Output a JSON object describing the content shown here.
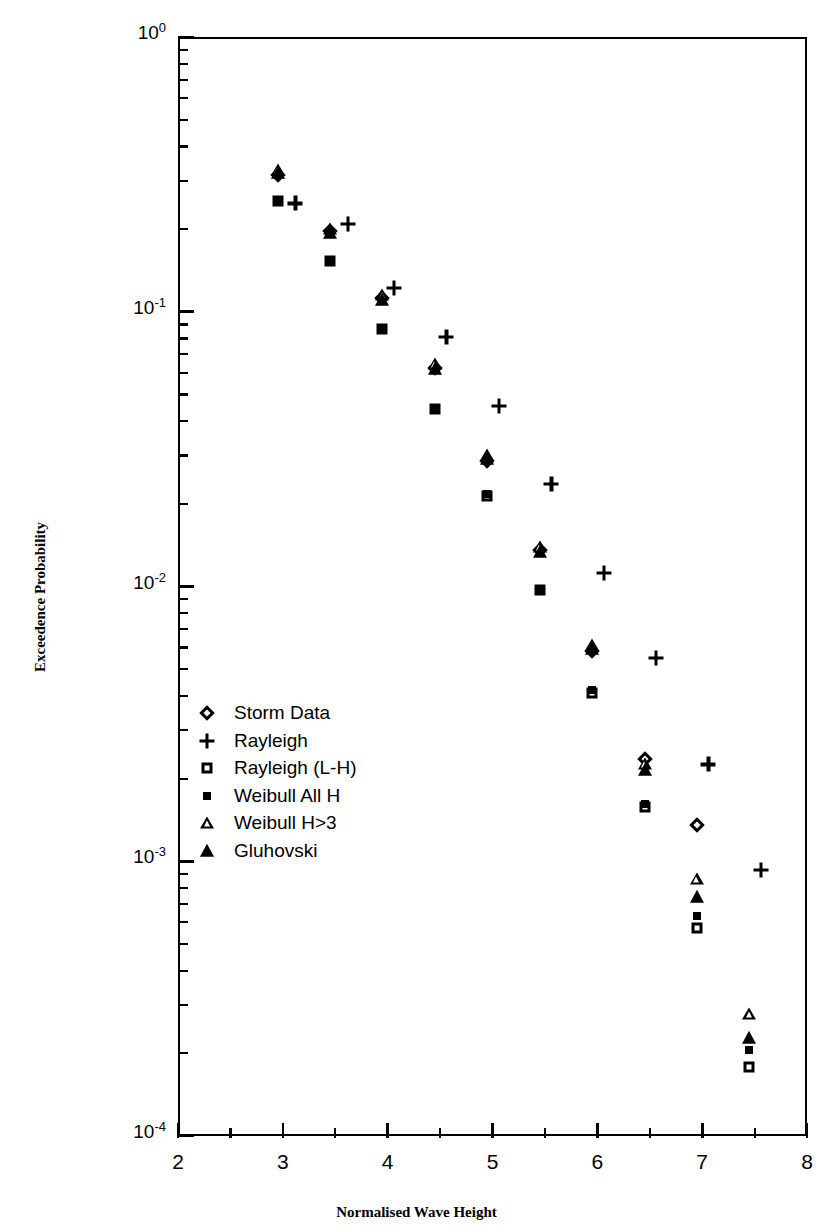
{
  "chart_data": {
    "type": "scatter",
    "title": "",
    "xlabel": "Normalised Wave Height",
    "ylabel": "Exceedence Probability",
    "xlim": [
      2,
      8
    ],
    "ylim": [
      0.0001,
      1
    ],
    "yscale": "log",
    "xscale": "linear",
    "grid": false,
    "legend_position": "inside-left",
    "xticks": [
      2,
      3,
      4,
      5,
      6,
      7,
      8
    ],
    "xticklabels": [
      "2",
      "3",
      "4",
      "5",
      "6",
      "7",
      "8"
    ],
    "yticks": [
      1,
      0.1,
      0.01,
      0.001,
      0.0001
    ],
    "yticklabels": [
      "10",
      "10",
      "10",
      "10",
      "10"
    ],
    "yticklabel_exponents": [
      "0",
      "-1",
      "-2",
      "-3",
      "-4"
    ],
    "x": [
      3.0,
      3.5,
      4.0,
      4.5,
      5.0,
      5.5,
      6.0,
      6.5,
      7.0,
      7.5
    ],
    "series": [
      {
        "name": "Storm Data",
        "marker": "open-diamond",
        "x": [
          2.95,
          3.45,
          3.95,
          4.45,
          4.95,
          5.45,
          5.95,
          6.45,
          6.95
        ],
        "values": [
          0.315,
          0.196,
          0.112,
          0.0625,
          0.0287,
          0.0136,
          0.0058,
          0.00235,
          0.00136
        ]
      },
      {
        "name": "Rayleigh",
        "marker": "plus",
        "x": [
          3.12,
          3.62,
          4.06,
          4.56,
          5.06,
          5.56,
          6.06,
          6.56,
          7.06,
          7.56
        ],
        "values": [
          0.248,
          0.209,
          0.122,
          0.081,
          0.0455,
          0.0236,
          0.0112,
          0.0055,
          0.00225,
          0.00093
        ]
      },
      {
        "name": "Rayleigh (L-H)",
        "marker": "open-square",
        "x": [
          2.95,
          3.45,
          3.95,
          4.45,
          4.95,
          5.45,
          5.95,
          6.45,
          6.95,
          7.45
        ],
        "values": [
          0.252,
          0.153,
          0.0865,
          0.0442,
          0.0213,
          0.0097,
          0.0041,
          0.00157,
          0.00057,
          0.000178
        ]
      },
      {
        "name": "Weibull All H",
        "marker": "filled-square",
        "x": [
          2.95,
          3.45,
          3.95,
          4.45,
          4.95,
          5.45,
          5.95,
          6.45,
          6.95,
          7.45
        ],
        "values": [
          0.252,
          0.153,
          0.0865,
          0.0442,
          0.0217,
          0.0098,
          0.0042,
          0.00161,
          0.00063,
          0.000205
        ]
      },
      {
        "name": "Weibull H>3",
        "marker": "open-triangle",
        "x": [
          2.95,
          3.45,
          3.95,
          4.45,
          4.95,
          5.45,
          5.95,
          6.45,
          6.95,
          7.45
        ],
        "values": [
          0.327,
          0.2,
          0.1155,
          0.0645,
          0.0302,
          0.0139,
          0.0061,
          0.00226,
          0.00086,
          0.000277
        ]
      },
      {
        "name": "Gluhovski",
        "marker": "filled-triangle",
        "x": [
          2.95,
          3.45,
          3.95,
          4.45,
          4.95,
          5.45,
          5.95,
          6.45,
          6.95,
          7.45
        ],
        "values": [
          0.32,
          0.194,
          0.1105,
          0.0617,
          0.0292,
          0.0134,
          0.0059,
          0.00215,
          0.00074,
          0.000228
        ]
      }
    ]
  },
  "legend": {
    "items": [
      {
        "label": "Storm Data",
        "marker": "open-diamond"
      },
      {
        "label": "Rayleigh",
        "marker": "plus"
      },
      {
        "label": "Rayleigh (L-H)",
        "marker": "open-square"
      },
      {
        "label": "Weibull All H",
        "marker": "filled-square"
      },
      {
        "label": "Weibull H>3",
        "marker": "open-triangle"
      },
      {
        "label": "Gluhovski",
        "marker": "filled-triangle"
      }
    ]
  },
  "colors": {
    "foreground": "#000000",
    "background": "#ffffff"
  }
}
